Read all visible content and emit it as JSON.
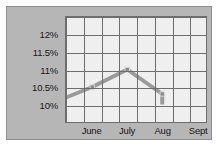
{
  "figure": {
    "panel_color": "#b6b6b6",
    "plot_background": "#efefef",
    "grid_color": "#6d6d6d",
    "series_color": "#9a9a9a",
    "marker_color": "#8a8a8a"
  },
  "chart_data": {
    "type": "line",
    "title": "",
    "xlabel": "",
    "ylabel": "",
    "categories": [
      "June",
      "July",
      "Aug",
      "Sept"
    ],
    "values": [
      10.5,
      11.0,
      10.3,
      null
    ],
    "series": [
      {
        "name": "rate",
        "points": [
          {
            "x": 0.0,
            "label": "",
            "value": 10.2,
            "marker": false
          },
          {
            "x": 1.0,
            "label": "June",
            "value": 10.5,
            "marker": true
          },
          {
            "x": 2.0,
            "label": "July",
            "value": 11.0,
            "marker": true
          },
          {
            "x": 3.0,
            "label": "Aug",
            "value": 10.3,
            "marker": true
          },
          {
            "x": 3.0,
            "label": "",
            "value": 10.0,
            "marker": false
          }
        ]
      }
    ],
    "ylim": [
      9.75,
      12.25
    ],
    "yticks": [
      10,
      10.5,
      11,
      11.5,
      12
    ],
    "ytick_labels": [
      "10%",
      "11.5%",
      "11%",
      "10.5%",
      "12%"
    ],
    "y_axis": {
      "labels": [
        {
          "text": "12%",
          "value": 12
        },
        {
          "text": "11.5%",
          "value": 11.5
        },
        {
          "text": "11%",
          "value": 11
        },
        {
          "text": "10.5%",
          "value": 10.5
        },
        {
          "text": "10%",
          "value": 10
        }
      ]
    },
    "x_axis": {
      "labels": [
        {
          "text": "June",
          "pos": 1.5
        },
        {
          "text": "July",
          "pos": 3.5
        },
        {
          "text": "Aug",
          "pos": 5.5
        },
        {
          "text": "Sept",
          "pos": 7.5
        }
      ],
      "columns": 8
    },
    "grid": true,
    "grid_rows": 6,
    "grid_columns": 8,
    "legend": "none"
  }
}
